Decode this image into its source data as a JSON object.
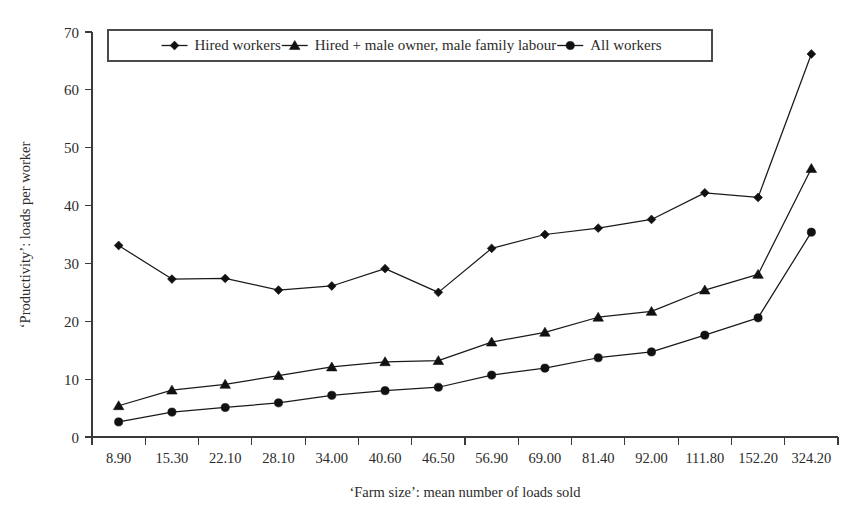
{
  "chart_data": {
    "type": "line",
    "title": "",
    "xlabel": "‘Farm size’: mean number of loads sold",
    "ylabel": "‘Productivity’: loads per worker",
    "categories": [
      "8.90",
      "15.30",
      "22.10",
      "28.10",
      "34.00",
      "40.60",
      "46.50",
      "56.90",
      "69.00",
      "81.40",
      "92.00",
      "111.80",
      "152.20",
      "324.20"
    ],
    "ylim": [
      0,
      70
    ],
    "yticks": [
      "0",
      "10",
      "20",
      "30",
      "40",
      "50",
      "60",
      "70"
    ],
    "ytick_values": [
      0,
      10,
      20,
      30,
      40,
      50,
      60,
      70
    ],
    "grid": false,
    "legend_position": "top-inside",
    "series": [
      {
        "name": "Hired workers",
        "marker": "diamond",
        "values": [
          33.1,
          27.3,
          27.4,
          25.4,
          26.1,
          29.1,
          25.0,
          32.6,
          35.0,
          36.1,
          37.6,
          42.2,
          41.4,
          66.2
        ]
      },
      {
        "name": "Hired + male owner, male family labour",
        "marker": "triangle",
        "values": [
          5.4,
          8.1,
          9.1,
          10.6,
          12.1,
          13.0,
          13.2,
          16.4,
          18.1,
          20.7,
          21.7,
          25.4,
          28.1,
          46.4
        ]
      },
      {
        "name": "All workers",
        "marker": "circle",
        "values": [
          2.6,
          4.3,
          5.1,
          5.9,
          7.2,
          8.0,
          8.6,
          10.7,
          11.9,
          13.7,
          14.7,
          17.6,
          20.6,
          35.4
        ]
      }
    ]
  },
  "colors": {
    "line": "#1a1a1a",
    "marker": "#111111",
    "axis": "#3a3a3a",
    "text": "#2b2b2b",
    "background": "#ffffff"
  }
}
